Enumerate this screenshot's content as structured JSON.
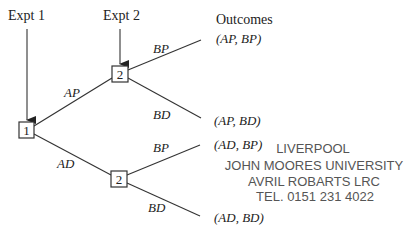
{
  "diagram": {
    "type": "tree-diagram",
    "headers": {
      "expt1": "Expt 1",
      "expt2": "Expt 2",
      "outcomes": "Outcomes"
    },
    "nodes": {
      "root": "1",
      "upper": "2",
      "lower": "2"
    },
    "branches": {
      "ap": "AP",
      "ad": "AD",
      "upper_bp": "BP",
      "upper_bd": "BD",
      "lower_bp": "BP",
      "lower_bd": "BD"
    },
    "outcomes": [
      "(AP, BP)",
      "(AP, BD)",
      "(AD, BP)",
      "(AD, BD)"
    ],
    "stamp": {
      "line1": "LIVERPOOL",
      "line2": "JOHN MOORES UNIVERSITY",
      "line3": "AVRIL ROBARTS LRC",
      "line4": "TEL. 0151 231 4022"
    }
  }
}
